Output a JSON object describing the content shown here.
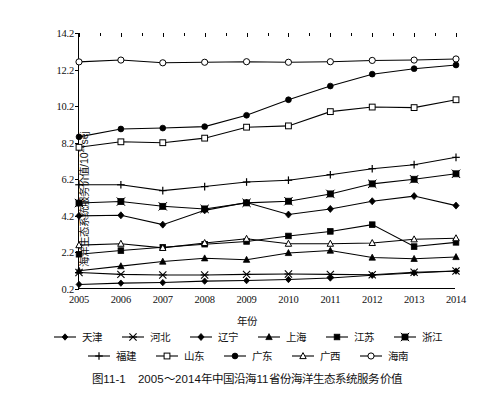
{
  "figure": {
    "caption_number": "图11-1",
    "caption_text": "2005～2014年中国沿海11省份海洋生态系统服务价值"
  },
  "axes": {
    "ylabel": "海洋生态系统服务价值/10",
    "ylabel_exponent": "22",
    "ylabel_unit": "sej",
    "xlabel": "年份",
    "ytick_labels": [
      "0.2",
      "2.2",
      "4.2",
      "6.2",
      "8.2",
      "10.2",
      "12.2",
      "14.2"
    ],
    "xtick_labels": [
      "2005",
      "2006",
      "2007",
      "2008",
      "2009",
      "2010",
      "2011",
      "2012",
      "2013",
      "2014"
    ]
  },
  "chart_data": {
    "type": "line",
    "title": "2005～2014年中国沿海11省份海洋生态系统服务价值",
    "xlabel": "年份",
    "ylabel": "海洋生态系统服务价值/10^22 sej",
    "categories": [
      "2005",
      "2006",
      "2007",
      "2008",
      "2009",
      "2010",
      "2011",
      "2012",
      "2013",
      "2014"
    ],
    "ylim": [
      0.2,
      14.2
    ],
    "ytick_step": 2.0,
    "grid": false,
    "legend_position": "below",
    "series": [
      {
        "name": "天津",
        "marker": "diamond-small",
        "values": [
          0.45,
          0.52,
          0.55,
          0.63,
          0.66,
          0.72,
          0.8,
          0.95,
          1.08,
          1.18
        ]
      },
      {
        "name": "河北",
        "marker": "asterisk",
        "values": [
          1.1,
          1.0,
          0.97,
          0.97,
          1.0,
          1.02,
          1.0,
          0.98,
          1.12,
          1.18
        ]
      },
      {
        "name": "辽宁",
        "marker": "diamond-filled",
        "values": [
          4.2,
          4.23,
          3.72,
          4.5,
          4.93,
          4.27,
          4.58,
          5.0,
          5.28,
          4.76
        ]
      },
      {
        "name": "上海",
        "marker": "triangle-filled",
        "values": [
          1.2,
          1.45,
          1.7,
          1.88,
          1.8,
          2.17,
          2.3,
          1.92,
          1.85,
          1.95
        ]
      },
      {
        "name": "江苏",
        "marker": "square-filled",
        "values": [
          2.1,
          2.3,
          2.48,
          2.65,
          2.8,
          3.1,
          3.35,
          3.72,
          2.52,
          2.75
        ]
      },
      {
        "name": "浙江",
        "marker": "square-x",
        "values": [
          4.9,
          4.98,
          4.72,
          4.58,
          4.91,
          5.0,
          5.4,
          5.95,
          6.2,
          6.5
        ]
      },
      {
        "name": "福建",
        "marker": "plus",
        "values": [
          5.9,
          5.9,
          5.58,
          5.8,
          6.05,
          6.15,
          6.45,
          6.78,
          7.0,
          7.4
        ]
      },
      {
        "name": "山东",
        "marker": "square-open",
        "values": [
          7.95,
          8.25,
          8.2,
          8.45,
          9.05,
          9.12,
          9.9,
          10.15,
          10.12,
          10.55
        ]
      },
      {
        "name": "广东",
        "marker": "circle-filled",
        "values": [
          8.52,
          8.95,
          9.0,
          9.08,
          9.7,
          10.55,
          11.3,
          11.95,
          12.25,
          12.45
        ]
      },
      {
        "name": "广西",
        "marker": "triangle-open",
        "values": [
          2.6,
          2.68,
          2.45,
          2.72,
          2.95,
          2.68,
          2.68,
          2.72,
          2.92,
          2.98
        ]
      },
      {
        "name": "海南",
        "marker": "circle-open",
        "values": [
          12.62,
          12.72,
          12.57,
          12.6,
          12.63,
          12.6,
          12.63,
          12.7,
          12.72,
          12.78
        ]
      }
    ]
  },
  "legend": {
    "rows": [
      [
        {
          "label": "天津"
        },
        {
          "label": "河北"
        },
        {
          "label": "辽宁"
        },
        {
          "label": "上海"
        },
        {
          "label": "江苏"
        },
        {
          "label": "浙江"
        }
      ],
      [
        {
          "label": "福建"
        },
        {
          "label": "山东"
        },
        {
          "label": "广东"
        },
        {
          "label": "广西"
        },
        {
          "label": "海南"
        }
      ]
    ]
  },
  "colors": {
    "line": "#000000",
    "background": "#ffffff"
  }
}
